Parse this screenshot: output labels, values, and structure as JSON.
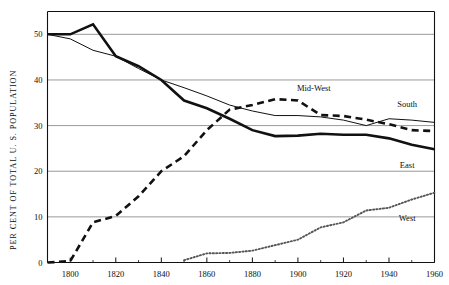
{
  "chart_data": {
    "type": "line",
    "title": "",
    "subtitle": "",
    "xlabel": "",
    "ylabel": "PER CENT OF TOTAL U. S. POPULATION",
    "xlim": [
      1790,
      1960
    ],
    "ylim": [
      0,
      55
    ],
    "grid": true,
    "gridlines_y": [
      0,
      10,
      20,
      30,
      40,
      50
    ],
    "legend_position": "inline-right",
    "xticks": [
      1800,
      1820,
      1840,
      1860,
      1880,
      1900,
      1920,
      1940,
      1960
    ],
    "xticklabels": [
      "1800",
      "1820",
      "1840",
      "1860",
      "1880",
      "1900",
      "1920",
      "1940",
      "1960"
    ],
    "xticks_minor": [
      1810,
      1830,
      1850,
      1870,
      1890,
      1910,
      1930,
      1950
    ],
    "yticks": [
      0,
      10,
      20,
      30,
      40,
      50
    ],
    "yticklabels": [
      "0",
      "10",
      "20",
      "30",
      "40",
      "50"
    ],
    "series": [
      {
        "name": "East",
        "label": "East",
        "style": "solid-thick",
        "color": "#111111",
        "x": [
          1790,
          1800,
          1810,
          1820,
          1830,
          1840,
          1850,
          1860,
          1870,
          1880,
          1890,
          1900,
          1910,
          1920,
          1930,
          1940,
          1950,
          1960
        ],
        "values": [
          50.0,
          50.0,
          52.2,
          45.2,
          43.0,
          40.0,
          35.5,
          33.8,
          31.5,
          29.0,
          27.7,
          27.8,
          28.2,
          28.0,
          28.0,
          27.2,
          25.8,
          24.8
        ]
      },
      {
        "name": "South",
        "label": "South",
        "style": "solid-thin",
        "color": "#111111",
        "x": [
          1790,
          1800,
          1810,
          1820,
          1830,
          1840,
          1850,
          1860,
          1870,
          1880,
          1890,
          1900,
          1910,
          1920,
          1930,
          1940,
          1950,
          1960
        ],
        "values": [
          50.0,
          49.0,
          46.5,
          45.2,
          42.5,
          40.0,
          38.3,
          36.5,
          34.5,
          33.2,
          32.2,
          32.2,
          31.9,
          31.2,
          30.0,
          31.5,
          31.2,
          30.7
        ]
      },
      {
        "name": "Mid-West",
        "label": "Mid-West",
        "style": "dashed",
        "color": "#111111",
        "x": [
          1790,
          1800,
          1810,
          1820,
          1830,
          1840,
          1850,
          1860,
          1870,
          1880,
          1890,
          1900,
          1910,
          1920,
          1930,
          1940,
          1950,
          1960
        ],
        "values": [
          0.0,
          0.3,
          8.8,
          10.2,
          14.5,
          20.0,
          23.3,
          29.0,
          33.5,
          34.5,
          35.8,
          35.5,
          32.3,
          32.1,
          31.3,
          30.3,
          29.0,
          28.8
        ]
      },
      {
        "name": "West",
        "label": "West",
        "style": "dotted",
        "color": "#555555",
        "x": [
          1850,
          1860,
          1870,
          1880,
          1890,
          1900,
          1910,
          1920,
          1930,
          1940,
          1950,
          1960
        ],
        "values": [
          0.5,
          2.0,
          2.1,
          2.6,
          3.8,
          5.0,
          7.7,
          8.8,
          11.4,
          12.0,
          13.8,
          15.3
        ]
      }
    ],
    "annotations": [
      {
        "text": "Mid-West",
        "x": 1907,
        "y": 37.5
      },
      {
        "text": "South",
        "x": 1948,
        "y": 34.0
      },
      {
        "text": "East",
        "x": 1948,
        "y": 20.8
      },
      {
        "text": "West",
        "x": 1948,
        "y": 9.0
      }
    ]
  }
}
